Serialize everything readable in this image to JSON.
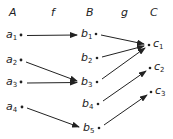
{
  "headers": {
    "A": "A",
    "f": "f",
    "B": "B",
    "g": "g",
    "C": "C"
  },
  "sets": {
    "A": [
      {
        "base": "a",
        "sub": "1"
      },
      {
        "base": "a",
        "sub": "2"
      },
      {
        "base": "a",
        "sub": "3"
      },
      {
        "base": "a",
        "sub": "4"
      }
    ],
    "B": [
      {
        "base": "b",
        "sub": "1"
      },
      {
        "base": "b",
        "sub": "2"
      },
      {
        "base": "b",
        "sub": "3"
      },
      {
        "base": "b",
        "sub": "4"
      },
      {
        "base": "b",
        "sub": "5"
      }
    ],
    "C": [
      {
        "base": "c",
        "sub": "1"
      },
      {
        "base": "c",
        "sub": "2"
      },
      {
        "base": "c",
        "sub": "3"
      }
    ]
  },
  "mappings": {
    "f": [
      [
        "a1",
        "b1"
      ],
      [
        "a2",
        "b3"
      ],
      [
        "a3",
        "b3"
      ],
      [
        "a4",
        "b5"
      ]
    ],
    "g": [
      [
        "b1",
        "c1"
      ],
      [
        "b2",
        "c1"
      ],
      [
        "b3",
        "c1"
      ],
      [
        "b4",
        "c2"
      ],
      [
        "b5",
        "c3"
      ]
    ]
  },
  "colors": {
    "ink": "#222222",
    "background": "#ffffff"
  }
}
